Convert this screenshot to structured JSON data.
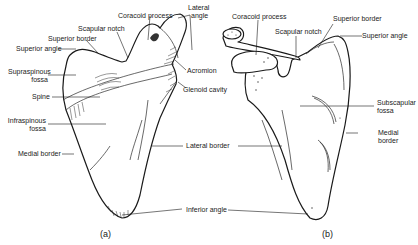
{
  "figure": {
    "panel_a": {
      "caption": "(a)",
      "labels": {
        "coracoid_process": "Coracoid process",
        "lateral_angle_1": "Lateral",
        "lateral_angle_2": "angle",
        "scapular_notch": "Scapular notch",
        "superior_border": "Superior border",
        "superior_angle": "Superior angle",
        "supraspinous_fossa_1": "Supraspinous",
        "supraspinous_fossa_2": "fossa",
        "acromion": "Acromion",
        "spine": "Spine",
        "glenoid_cavity": "Glenoid cavity",
        "infraspinous_fossa_1": "Infraspinous",
        "infraspinous_fossa_2": "fossa",
        "medial_border": "Medial border"
      }
    },
    "panel_b": {
      "caption": "(b)",
      "labels": {
        "coracoid_process": "Coracoid process",
        "scapular_notch": "Scapular notch",
        "superior_border": "Superior border",
        "superior_angle": "Superior angle",
        "subscapular_fossa_1": "Subscapular",
        "subscapular_fossa_2": "fossa",
        "medial_border_1": "Medial",
        "medial_border_2": "border"
      }
    },
    "shared_labels": {
      "lateral_border": "Lateral border",
      "inferior_angle": "Inferior angle"
    },
    "colors": {
      "line": "#1a1a1a",
      "background": "#ffffff"
    }
  }
}
